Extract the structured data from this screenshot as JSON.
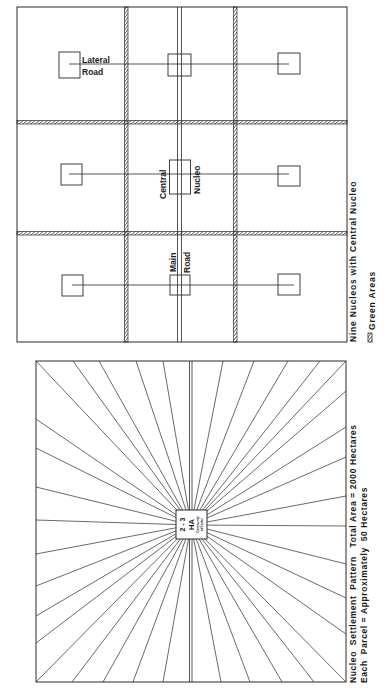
{
  "top_diagram": {
    "title": "Nine Nucleos with Central Nucleo",
    "legend_label": "Green Areas",
    "labels": {
      "lateral_road_1": "Lateral",
      "lateral_road_2": "Road",
      "central_nucleo_1": "Central",
      "central_nucleo_2": "Nucleo",
      "main_road_1": "Main",
      "main_road_2": "Road"
    },
    "grid": {
      "rows": 3,
      "cols": 3
    },
    "nucleos": 9
  },
  "bottom_diagram": {
    "title_line_1": "Nucleo  Settlement  Pattern   Total Area = 2000 Hectares",
    "title_line_2": "Each  Parcel = Approximately  50 Hectares",
    "center_label_1": "2 - 3",
    "center_label_2": "HA",
    "center_label_3": "Community",
    "center_label_4": "at Center"
  },
  "colors": {
    "line": "#2a2a2a",
    "background": "#ffffff"
  }
}
